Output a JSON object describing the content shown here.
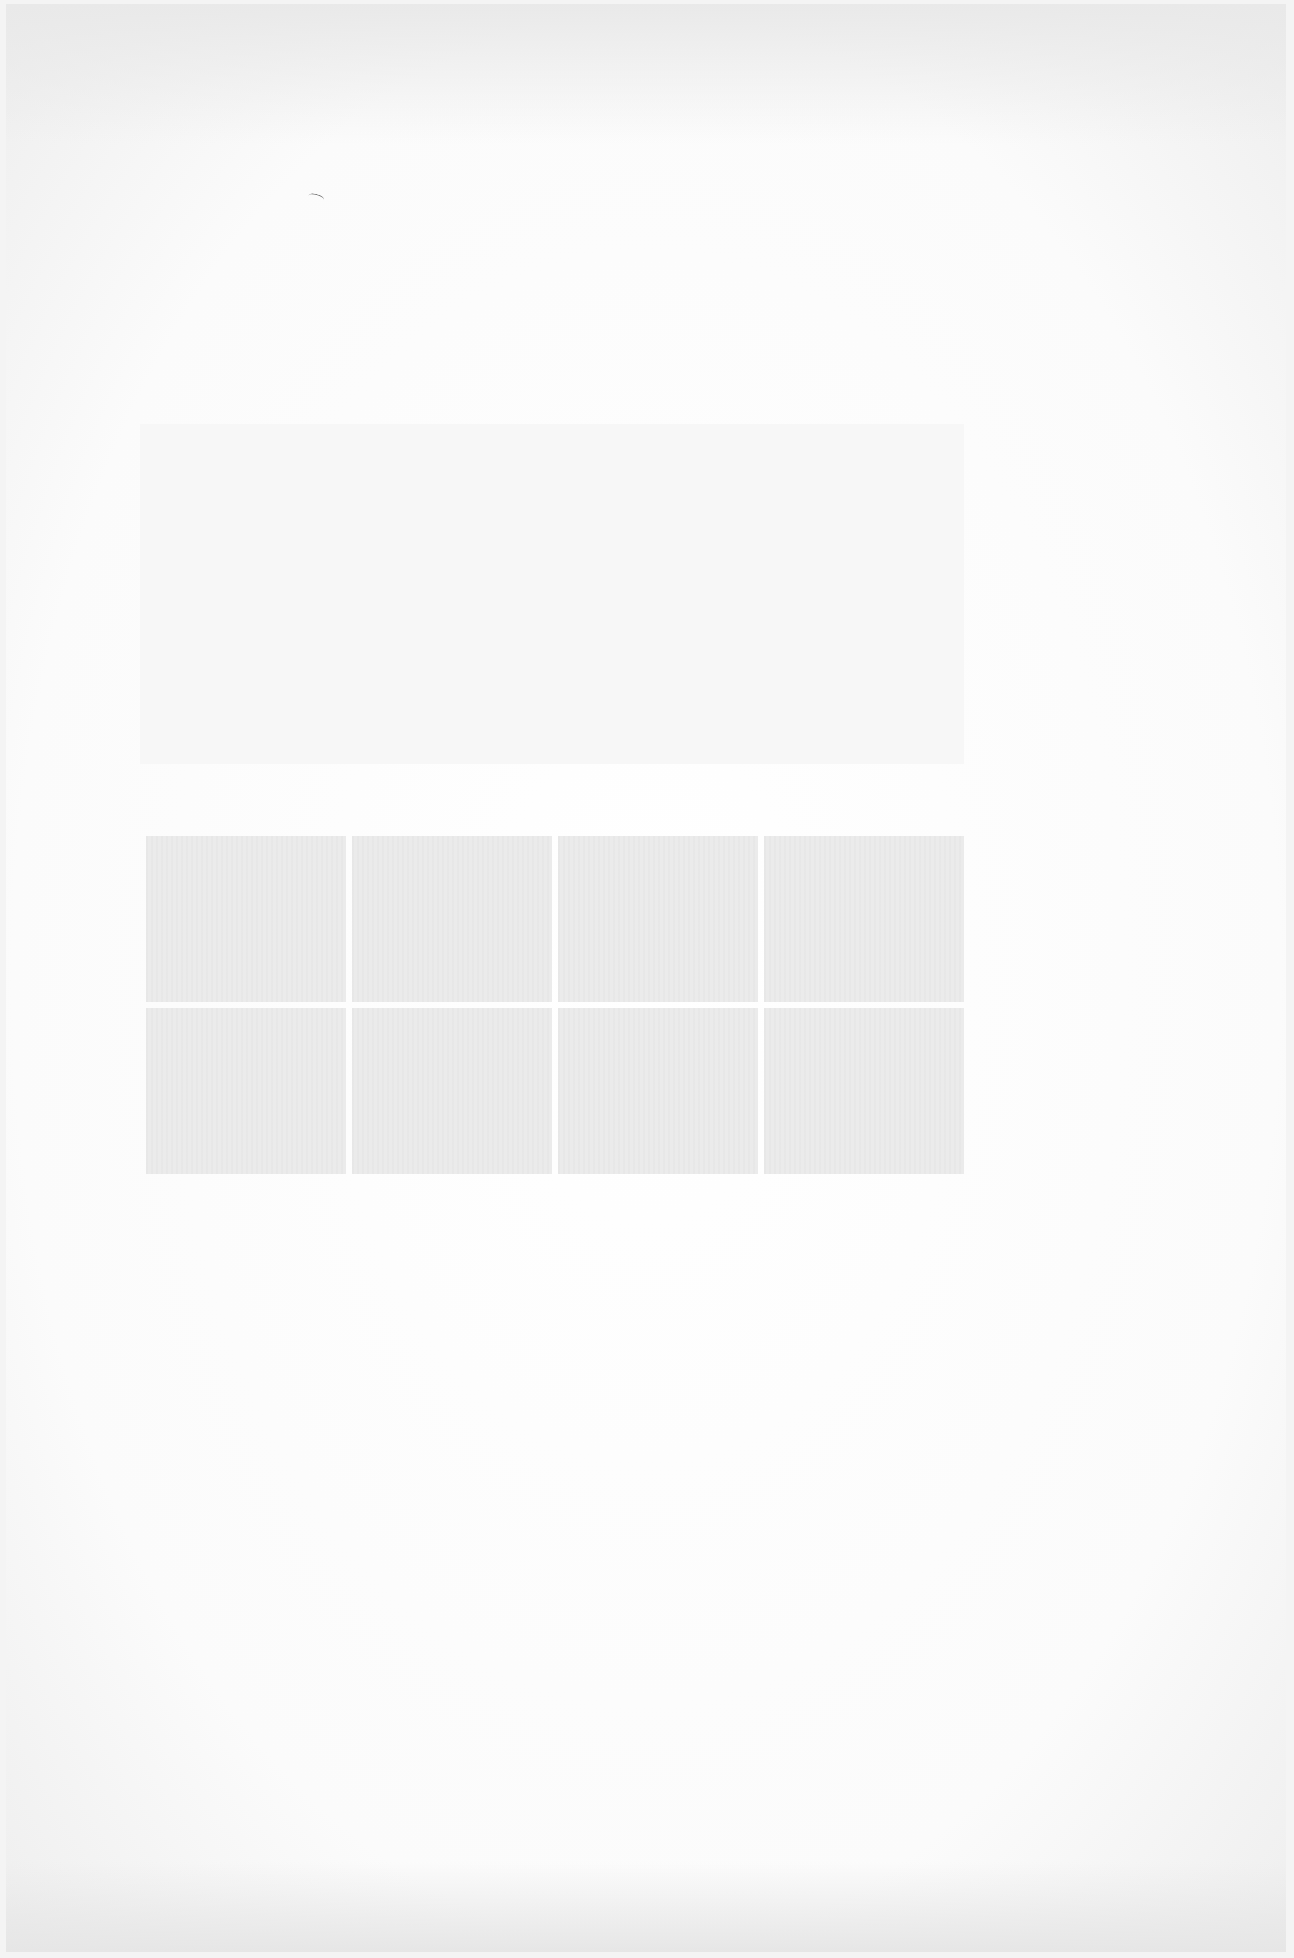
{
  "document": {
    "type": "scanned-page",
    "text_content": "",
    "regions": [
      {
        "name": "upper-blank-block",
        "description": ""
      },
      {
        "name": "panel-grid",
        "rows": 2,
        "columns": 4,
        "panels": [
          "",
          "",
          "",
          "",
          "",
          "",
          "",
          ""
        ]
      }
    ]
  },
  "colors": {
    "paper": "#ffffff",
    "border": "#eeeeee",
    "panel": "#ebebeb"
  }
}
